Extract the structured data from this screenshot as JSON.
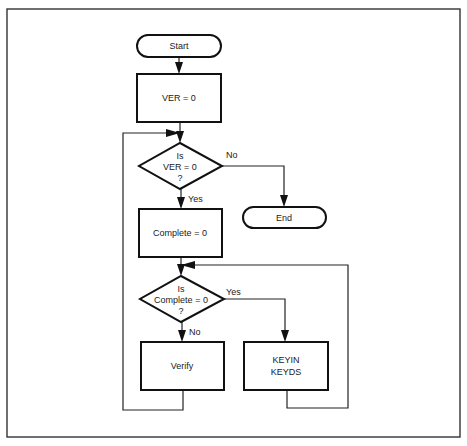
{
  "diagram": {
    "type": "flowchart",
    "nodes": {
      "start": {
        "label": "Start",
        "shape": "terminal"
      },
      "ver_init": {
        "label": "VER = 0",
        "shape": "process"
      },
      "ver_check": {
        "line1": "Is",
        "line2": "VER = 0",
        "line3": "?",
        "shape": "decision"
      },
      "end": {
        "label": "End",
        "shape": "terminal"
      },
      "complete_init": {
        "label": "Complete = 0",
        "shape": "process"
      },
      "complete_check": {
        "line1": "Is",
        "line2": "Complete = 0",
        "line3": "?",
        "shape": "decision"
      },
      "verify": {
        "label": "Verify",
        "shape": "process"
      },
      "keyin": {
        "line1": "KEYIN",
        "line2": "KEYDS",
        "shape": "process"
      }
    },
    "edge_labels": {
      "ver_check_no": "No",
      "ver_check_yes": "Yes",
      "complete_check_yes": "Yes",
      "complete_check_no": "No"
    },
    "edges": [
      {
        "from": "start",
        "to": "ver_init"
      },
      {
        "from": "ver_init",
        "to": "ver_check"
      },
      {
        "from": "ver_check",
        "to": "end",
        "label": "No"
      },
      {
        "from": "ver_check",
        "to": "complete_init",
        "label": "Yes"
      },
      {
        "from": "complete_init",
        "to": "complete_check"
      },
      {
        "from": "complete_check",
        "to": "keyin",
        "label": "Yes"
      },
      {
        "from": "complete_check",
        "to": "verify",
        "label": "No"
      },
      {
        "from": "keyin",
        "to": "complete_check"
      },
      {
        "from": "verify",
        "to": "ver_check"
      }
    ]
  }
}
